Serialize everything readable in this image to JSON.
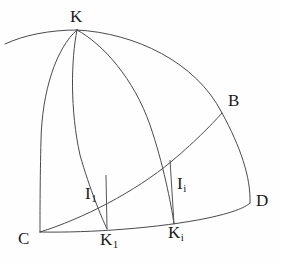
{
  "figure": {
    "kind": "geometric-diagram",
    "background_color": "#fefefe",
    "stroke_color": "#4a4a4f",
    "label_color": "#1b1b1b",
    "labels": [
      {
        "id": "K",
        "base": "K",
        "sub": ""
      },
      {
        "id": "B",
        "base": "B",
        "sub": ""
      },
      {
        "id": "D",
        "base": "D",
        "sub": ""
      },
      {
        "id": "C",
        "base": "C",
        "sub": ""
      },
      {
        "id": "I1",
        "base": "I",
        "sub": "1"
      },
      {
        "id": "Ii",
        "base": "I",
        "sub": "i"
      },
      {
        "id": "K1",
        "base": "K",
        "sub": "1"
      },
      {
        "id": "Ki",
        "base": "K",
        "sub": "i"
      }
    ],
    "points": {
      "K": {
        "x": 77,
        "y": 30
      },
      "B": {
        "x": 222,
        "y": 113
      },
      "D": {
        "x": 250,
        "y": 203
      },
      "C": {
        "x": 40,
        "y": 232
      },
      "K1": {
        "x": 107,
        "y": 229
      },
      "Ki": {
        "x": 174,
        "y": 224
      },
      "I1": {
        "x": 105,
        "y": 202
      },
      "Ii": {
        "x": 172,
        "y": 177
      }
    },
    "curves": [
      {
        "id": "top-arc-left",
        "from": "edge-left",
        "to": "K"
      },
      {
        "id": "arc-K-C",
        "from": "K",
        "to": "C"
      },
      {
        "id": "arc-K-K1",
        "from": "K",
        "to": "K1"
      },
      {
        "id": "arc-K-Ki",
        "from": "K",
        "to": "Ki"
      },
      {
        "id": "arc-K-B-D",
        "from": "K",
        "to": "D"
      },
      {
        "id": "arc-C-B",
        "from": "C",
        "to": "B"
      },
      {
        "id": "arc-C-D",
        "from": "C",
        "to": "D"
      }
    ],
    "segments": [
      {
        "id": "ordinate-1",
        "from": "I1",
        "to": "K1"
      },
      {
        "id": "ordinate-i",
        "from": "Ii",
        "to": "Ki"
      }
    ]
  }
}
